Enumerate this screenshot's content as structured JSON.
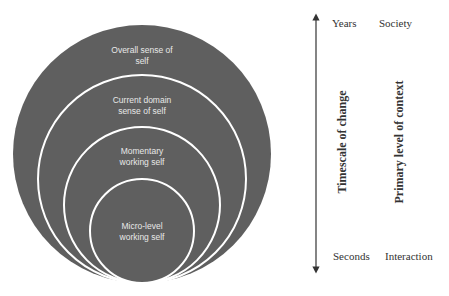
{
  "diagram": {
    "colors": {
      "circle_fill": "#5f5f5f",
      "circle_stroke": "#ffffff",
      "circle_text": "#e8e8e8",
      "axis_line": "#333333",
      "axis_text": "#333333"
    },
    "circles": [
      {
        "id": "overall",
        "line1": "Overall sense of",
        "line2": "self"
      },
      {
        "id": "current-domain",
        "line1": "Current domain",
        "line2": "sense of self"
      },
      {
        "id": "momentary",
        "line1": "Momentary",
        "line2": "working self"
      },
      {
        "id": "micro-level",
        "line1": "Micro-level",
        "line2": "working self"
      }
    ],
    "axis": {
      "timescale": {
        "title": "Timescale of change",
        "top": "Years",
        "bottom": "Seconds"
      },
      "context": {
        "title": "Primary level of context",
        "top": "Society",
        "bottom": "Interaction"
      }
    }
  }
}
